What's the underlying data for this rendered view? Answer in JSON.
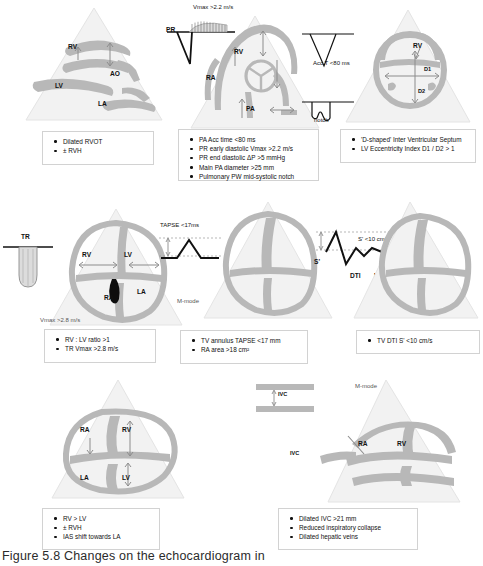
{
  "figure": {
    "caption": "Figure 5.8 Changes on the echocardiogram in",
    "palette": {
      "myocardium": "#b8b8b8",
      "sector": "#efefef",
      "waveform": "#111111",
      "box_border": "#d2d2d2",
      "text": "#111111"
    }
  },
  "panels": [
    {
      "id": "plax-rvot",
      "view": "parasternal-long-axis",
      "chamber_labels": [
        "RV",
        "AO",
        "LV",
        "LA"
      ],
      "findings": [
        "Dilated RVOT",
        "± RVH"
      ]
    },
    {
      "id": "rvot-pa",
      "view": "parasternal-short-axis-rvot",
      "chamber_labels": [
        "RV",
        "RA",
        "PA"
      ],
      "waveform_labels": {
        "pr": "PR",
        "pr_vmax": "Vmax >2.2 m/s",
        "acc_time": "Acc T <80 ms",
        "notch": "notch"
      },
      "findings": [
        "PA Acc time <80 ms",
        "PR early diastolic Vmax >2.2 m/s",
        "PR end diastolic ΔP >5 mmHg",
        "Main PA diameter >25 mm",
        "Pulmonary PW mid-systolic notch"
      ]
    },
    {
      "id": "d-shape-septum",
      "view": "parasternal-short-axis",
      "chamber_labels": [
        "RV"
      ],
      "measure_labels": [
        "D1",
        "D2"
      ],
      "findings": [
        "'D-shaped' Inter Ventricular Septum",
        "LV Eccentricity Index D1 / D2 > 1"
      ]
    },
    {
      "id": "a4c-rv-lv",
      "view": "apical-4-chamber",
      "chamber_labels": [
        "RV",
        "LV",
        "RA",
        "LA"
      ],
      "waveform_labels": {
        "tr": "TR",
        "tr_vmax": "Vmax >2.8 m/s"
      },
      "findings": [
        "RV : LV ratio >1",
        "TR Vmax  >2.8 m/s"
      ]
    },
    {
      "id": "tapse",
      "view": "apical-4-chamber",
      "waveform_labels": {
        "tapse": "TAPSE <17ms",
        "mode": "M-mode"
      },
      "findings": [
        "TV annulus TAPSE <17 mm",
        "RA area >18 cm²"
      ]
    },
    {
      "id": "tdi-s-prime",
      "view": "apical-4-chamber",
      "waveform_labels": {
        "s_prime": "S'",
        "s_prime_value": "S' <10 cm/s",
        "dti": "DTI",
        "pw": "PW"
      },
      "findings": [
        "TV DTI S' <10 cm/s"
      ]
    },
    {
      "id": "subcostal-rv",
      "view": "subcostal-4-chamber",
      "chamber_labels": [
        "RA",
        "RV",
        "LA",
        "LV"
      ],
      "findings": [
        "RV > LV",
        "± RVH",
        "IAS shift towards LA"
      ]
    },
    {
      "id": "ivc",
      "view": "subcostal-ivc",
      "chamber_labels": [
        "RA",
        "RV",
        "IVC"
      ],
      "waveform_labels": {
        "ivc": "IVC",
        "mode": "M-mode"
      },
      "findings": [
        "Dilated IVC >21 mm",
        "Reduced inspiratory collapse",
        "Dilated hepatic veins"
      ]
    }
  ]
}
